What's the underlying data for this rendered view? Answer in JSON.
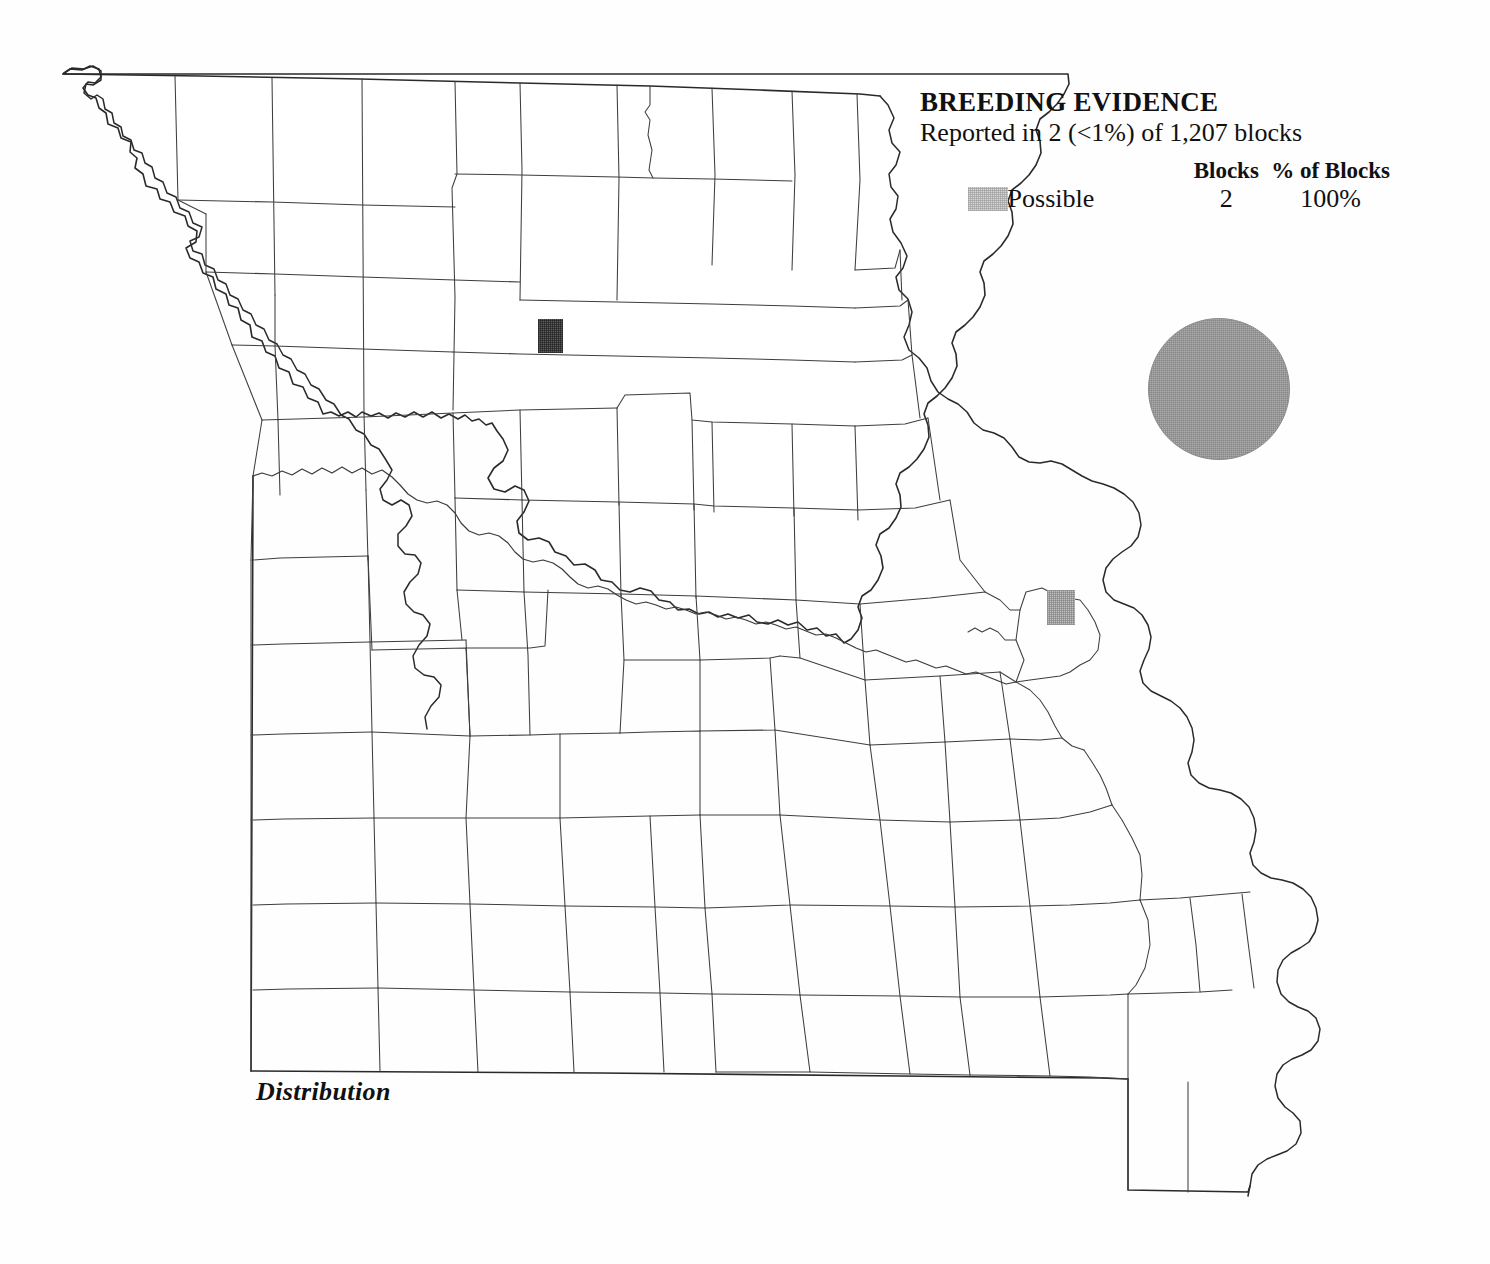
{
  "legend": {
    "title": "BREEDING EVIDENCE",
    "subtitle": "Reported in 2 (<1%) of 1,207 blocks",
    "header_blocks": "Blocks",
    "header_percent": "% of Blocks",
    "rows": [
      {
        "label": "Possible",
        "blocks": "2",
        "percent": "100%",
        "swatch_color": "#d6d6d6"
      }
    ]
  },
  "caption": {
    "distribution": "Distribution"
  },
  "map": {
    "state": "Missouri",
    "outline_color": "#2a2a2a",
    "county_line_color": "#3c3c3c",
    "background_color": "#ffffff",
    "markers": [
      {
        "name": "block-marker-northwest",
        "evidence": "Possible",
        "shade": "dark",
        "color": "#5d5d5d",
        "x": 538,
        "y": 319,
        "width": 25,
        "height": 34
      },
      {
        "name": "block-marker-east",
        "evidence": "Possible",
        "shade": "light",
        "color": "#bfbfbf",
        "x": 1047,
        "y": 590,
        "width": 28,
        "height": 35
      }
    ]
  },
  "species_symbol": {
    "shape": "circle",
    "fill_color": "#aeaeae",
    "diameter": 142
  }
}
